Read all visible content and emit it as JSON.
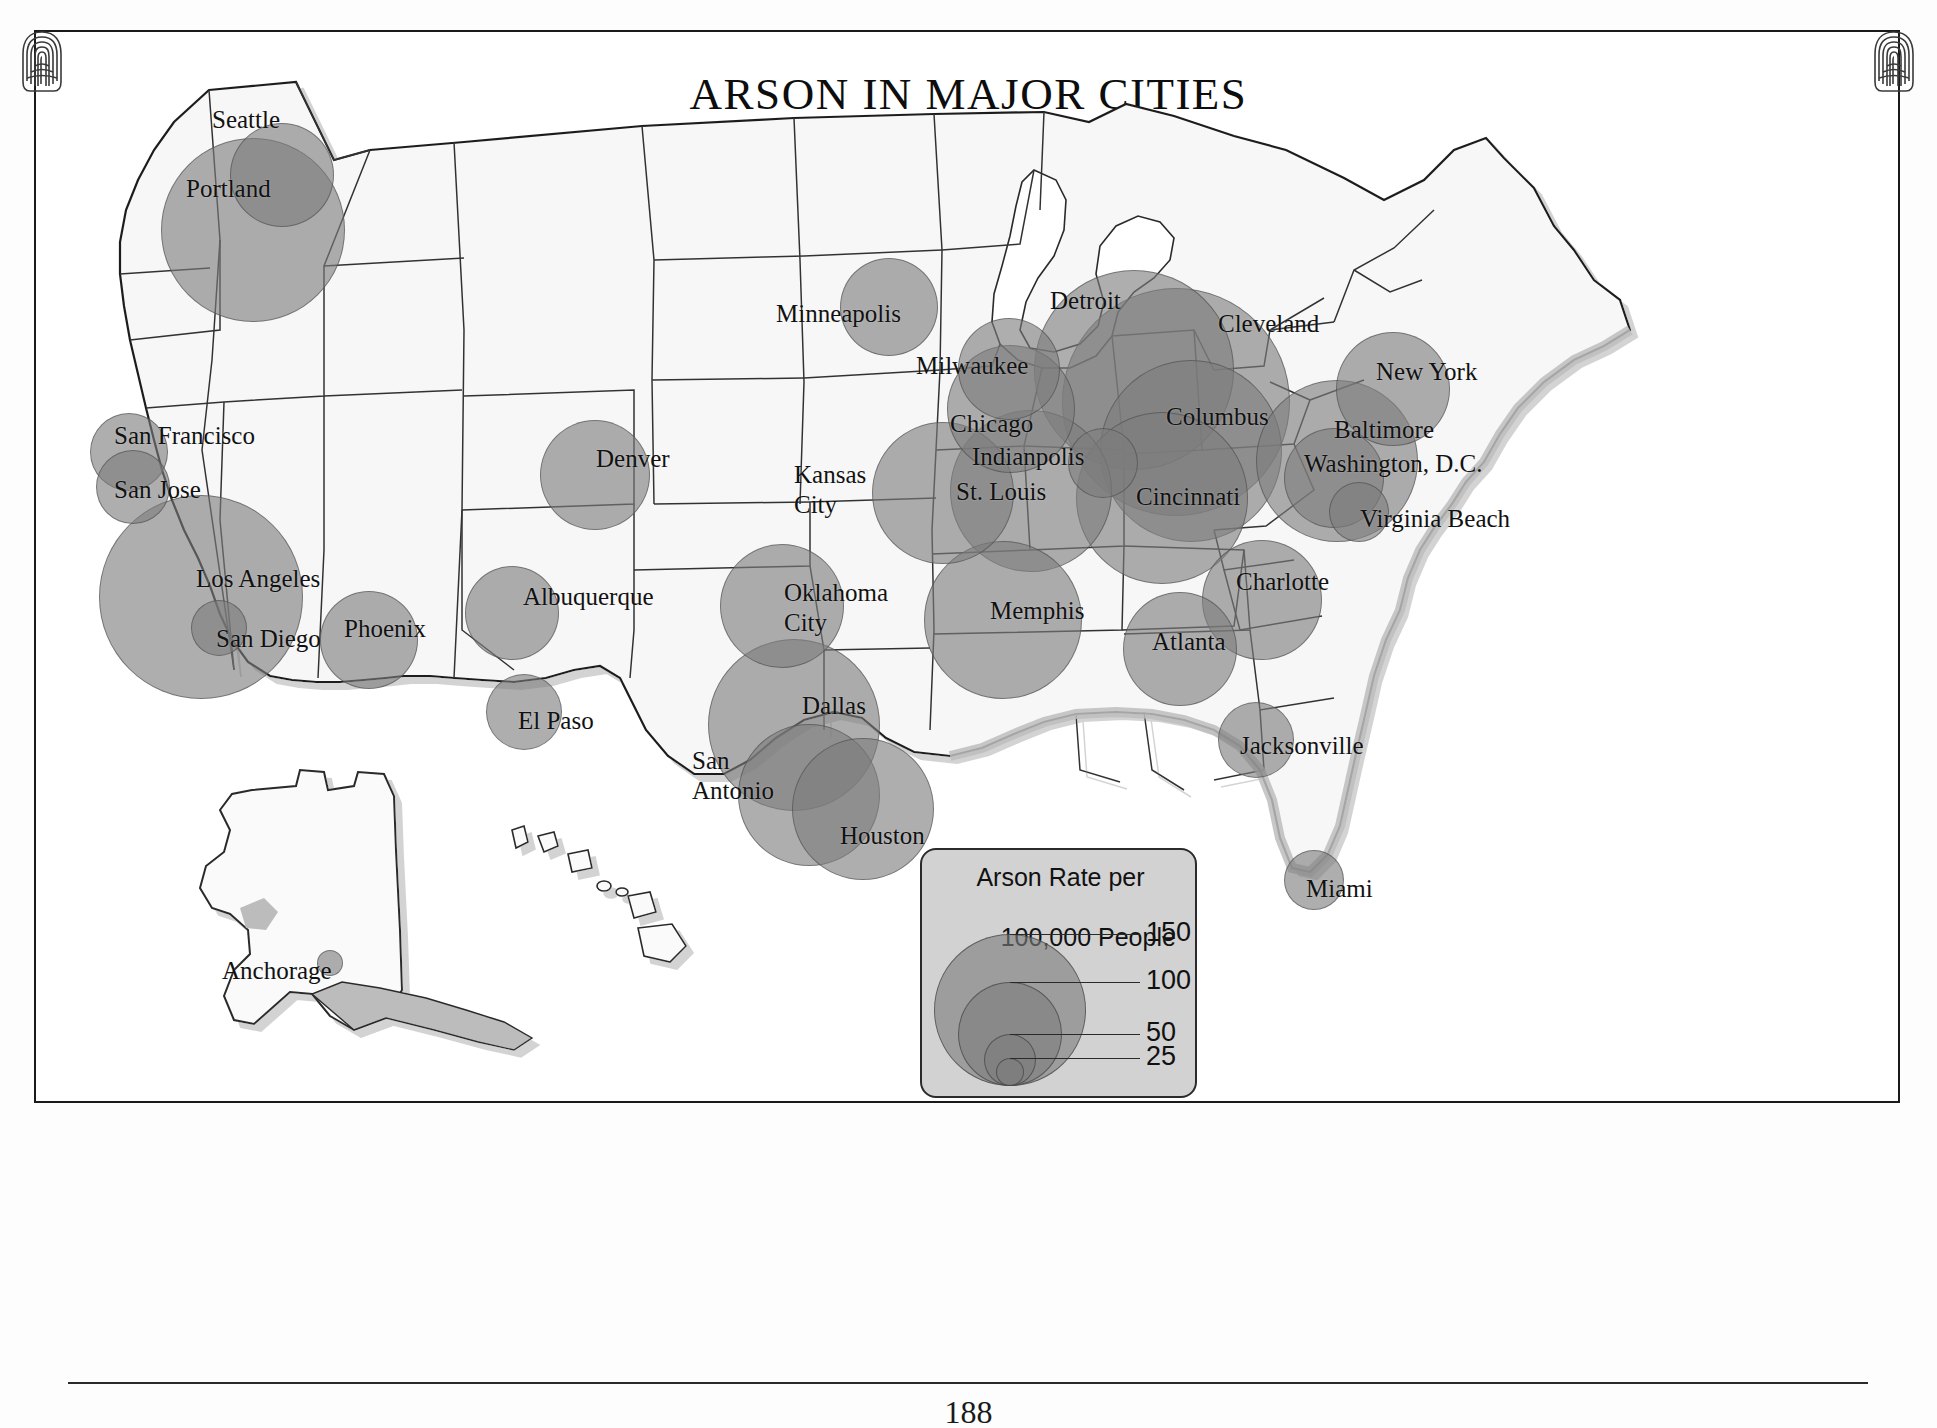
{
  "page": {
    "title": "ARSON IN MAJOR CITIES",
    "page_number": "188",
    "corner_ornament": "fingerprint-icon"
  },
  "legend": {
    "title_line1": "Arson Rate per",
    "title_line2": "100,000 People",
    "units": "per 100,000 people",
    "breaks": [
      {
        "value": "150",
        "diameter_px": 152
      },
      {
        "value": "100",
        "diameter_px": 104
      },
      {
        "value": "50",
        "diameter_px": 52
      },
      {
        "value": "25",
        "diameter_px": 28
      }
    ]
  },
  "chart_data": {
    "type": "bubble-map",
    "title": "ARSON IN MAJOR CITIES",
    "ylabel": "Arson Rate per 100,000 People",
    "legend_breaks": [
      150,
      100,
      50,
      25
    ],
    "region": "United States",
    "cities": [
      {
        "name": "Seattle",
        "rate": 72,
        "x": 196,
        "y": 93,
        "d": 104,
        "lx": 178,
        "ly": 76
      },
      {
        "name": "Portland",
        "rate": 126,
        "x": 127,
        "y": 108,
        "d": 184,
        "lx": 152,
        "ly": 145
      },
      {
        "name": "San Francisco",
        "rate": 55,
        "x": 56,
        "y": 383,
        "d": 78,
        "lx": 80,
        "ly": 392
      },
      {
        "name": "San Jose",
        "rate": 52,
        "x": 62,
        "y": 420,
        "d": 74,
        "lx": 80,
        "ly": 446
      },
      {
        "name": "Los Angeles",
        "rate": 142,
        "x": 65,
        "y": 465,
        "d": 204,
        "lx": 162,
        "ly": 535
      },
      {
        "name": "San Diego",
        "rate": 38,
        "x": 157,
        "y": 570,
        "d": 56,
        "lx": 182,
        "ly": 595
      },
      {
        "name": "Phoenix",
        "rate": 66,
        "x": 286,
        "y": 561,
        "d": 98,
        "lx": 310,
        "ly": 585
      },
      {
        "name": "Denver",
        "rate": 76,
        "x": 506,
        "y": 390,
        "d": 110,
        "lx": 562,
        "ly": 415
      },
      {
        "name": "Albuquerque",
        "rate": 62,
        "x": 431,
        "y": 536,
        "d": 94,
        "lx": 489,
        "ly": 553
      },
      {
        "name": "El Paso",
        "rate": 50,
        "x": 452,
        "y": 644,
        "d": 76,
        "lx": 484,
        "ly": 677
      },
      {
        "name": "Minneapolis",
        "rate": 66,
        "x": 806,
        "y": 228,
        "d": 98,
        "lx": 742,
        "ly": 270
      },
      {
        "name": "Milwaukee",
        "rate": 70,
        "x": 924,
        "y": 288,
        "d": 102,
        "lx": 882,
        "ly": 322
      },
      {
        "name": "Chicago",
        "rate": 88,
        "x": 913,
        "y": 315,
        "d": 128,
        "lx": 916,
        "ly": 380
      },
      {
        "name": "Detroit",
        "rate": 138,
        "x": 1000,
        "y": 240,
        "d": 200,
        "lx": 1016,
        "ly": 257
      },
      {
        "name": "Cleveland",
        "rate": 158,
        "x": 1028,
        "y": 258,
        "d": 228,
        "lx": 1184,
        "ly": 280
      },
      {
        "name": "Columbus",
        "rate": 126,
        "x": 1066,
        "y": 330,
        "d": 182,
        "lx": 1132,
        "ly": 373
      },
      {
        "name": "Cincinnati",
        "rate": 118,
        "x": 1042,
        "y": 382,
        "d": 172,
        "lx": 1102,
        "ly": 453
      },
      {
        "name": "Indianpolis",
        "rate": 48,
        "x": 1034,
        "y": 398,
        "d": 70,
        "lx": 938,
        "ly": 413
      },
      {
        "name": "St. Louis",
        "rate": 112,
        "x": 916,
        "y": 380,
        "d": 162,
        "lx": 922,
        "ly": 448
      },
      {
        "name": "Kansas City",
        "rate": 96,
        "x": 838,
        "y": 392,
        "d": 142,
        "lx": 760,
        "ly": 430
      },
      {
        "name": "Oklahoma City",
        "rate": 84,
        "x": 686,
        "y": 514,
        "d": 124,
        "lx": 750,
        "ly": 548
      },
      {
        "name": "Dallas",
        "rate": 118,
        "x": 674,
        "y": 609,
        "d": 172,
        "lx": 768,
        "ly": 662
      },
      {
        "name": "San Antonio",
        "rate": 96,
        "x": 704,
        "y": 694,
        "d": 142,
        "lx": 658,
        "ly": 716
      },
      {
        "name": "Houston",
        "rate": 98,
        "x": 758,
        "y": 708,
        "d": 142,
        "lx": 806,
        "ly": 792
      },
      {
        "name": "Memphis",
        "rate": 108,
        "x": 890,
        "y": 511,
        "d": 158,
        "lx": 956,
        "ly": 567
      },
      {
        "name": "Atlanta",
        "rate": 78,
        "x": 1089,
        "y": 562,
        "d": 114,
        "lx": 1118,
        "ly": 598
      },
      {
        "name": "Charlotte",
        "rate": 82,
        "x": 1168,
        "y": 510,
        "d": 120,
        "lx": 1202,
        "ly": 538
      },
      {
        "name": "Jacksonville",
        "rate": 52,
        "x": 1184,
        "y": 672,
        "d": 76,
        "lx": 1206,
        "ly": 702
      },
      {
        "name": "Miami",
        "rate": 42,
        "x": 1250,
        "y": 820,
        "d": 60,
        "lx": 1272,
        "ly": 845
      },
      {
        "name": "Virginia Beach",
        "rate": 42,
        "x": 1295,
        "y": 452,
        "d": 60,
        "lx": 1326,
        "ly": 475
      },
      {
        "name": "Washington, D.C.",
        "rate": 68,
        "x": 1250,
        "y": 398,
        "d": 100,
        "lx": 1270,
        "ly": 420
      },
      {
        "name": "Baltimore",
        "rate": 112,
        "x": 1222,
        "y": 350,
        "d": 162,
        "lx": 1300,
        "ly": 386
      },
      {
        "name": "New York",
        "rate": 78,
        "x": 1302,
        "y": 302,
        "d": 114,
        "lx": 1342,
        "ly": 328
      },
      {
        "name": "Anchorage",
        "rate": 22,
        "x": 283,
        "y": 920,
        "d": 26,
        "lx": 188,
        "ly": 927
      }
    ]
  }
}
